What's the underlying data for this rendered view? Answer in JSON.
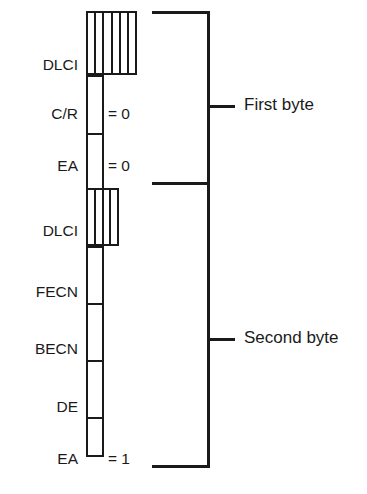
{
  "diagram": {
    "line_color": "#1a1a1a",
    "background": "#ffffff",
    "fields": [
      {
        "label": "DLCI",
        "value": "",
        "kind": "multi-bit",
        "cells": 6,
        "byte": "first"
      },
      {
        "label": "C/R",
        "value": "= 0",
        "kind": "single-bit",
        "cells": 1,
        "byte": "first"
      },
      {
        "label": "EA",
        "value": "= 0",
        "kind": "single-bit",
        "cells": 1,
        "byte": "first"
      },
      {
        "label": "DLCI",
        "value": "",
        "kind": "multi-bit",
        "cells": 4,
        "byte": "second"
      },
      {
        "label": "FECN",
        "value": "",
        "kind": "single-bit",
        "cells": 1,
        "byte": "second"
      },
      {
        "label": "BECN",
        "value": "",
        "kind": "single-bit",
        "cells": 1,
        "byte": "second"
      },
      {
        "label": "DE",
        "value": "",
        "kind": "single-bit",
        "cells": 1,
        "byte": "second"
      },
      {
        "label": "EA",
        "value": "= 1",
        "kind": "single-bit",
        "cells": 1,
        "byte": "second"
      }
    ],
    "brackets": [
      {
        "label": "First byte"
      },
      {
        "label": "Second byte"
      }
    ]
  }
}
